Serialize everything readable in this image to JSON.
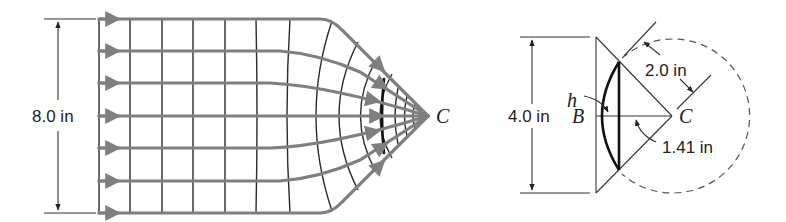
{
  "left_figure": {
    "height_label": "8.0 in",
    "point_label": "C",
    "streamlines": 7,
    "flow_color": "#7f7f7f",
    "grid_color": "#2a2a2a"
  },
  "right_figure": {
    "height_label": "4.0 in",
    "radius_label": "2.0 in",
    "distance_label": "1.41 in",
    "h_label": "h",
    "b_label": "B",
    "c_label": "C"
  }
}
